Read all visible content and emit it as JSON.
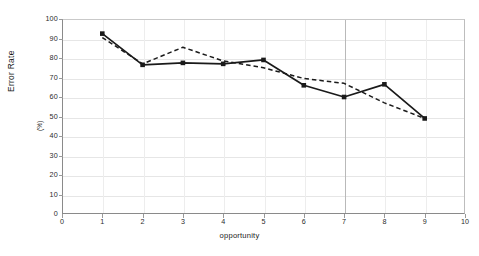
{
  "chart_data": {
    "type": "line",
    "title": "",
    "xlabel": "opportunity",
    "ylabel": "Error Rate",
    "ylabel_unit": "(%)",
    "xlim": [
      0,
      10
    ],
    "ylim": [
      0,
      100
    ],
    "xticks": [
      0,
      1,
      2,
      3,
      4,
      5,
      6,
      7,
      8,
      9,
      10
    ],
    "yticks": [
      0,
      10,
      20,
      30,
      40,
      50,
      60,
      70,
      80,
      90,
      100
    ],
    "grid": true,
    "legend": "none",
    "x": [
      1,
      2,
      3,
      4,
      5,
      6,
      7,
      8,
      9
    ],
    "series": [
      {
        "name": "solid",
        "style": "solid",
        "marker": "square",
        "color": "#1a1a1a",
        "values": [
          92.5,
          76.5,
          77.5,
          77.0,
          79.0,
          66.0,
          60.0,
          66.5,
          49.0
        ]
      },
      {
        "name": "dashed",
        "style": "dashed",
        "marker": "none",
        "color": "#1a1a1a",
        "values": [
          90.5,
          77.0,
          85.5,
          78.5,
          75.0,
          69.5,
          67.0,
          57.0,
          49.0
        ]
      }
    ],
    "annotations": [
      {
        "type": "vertical-line",
        "x": 7,
        "color": "#b9b9b9"
      }
    ]
  },
  "axis": {
    "y_labels": [
      "100",
      "90",
      "80",
      "70",
      "60",
      "50",
      "40",
      "30",
      "20",
      "10",
      "0"
    ],
    "x_labels": [
      "0",
      "1",
      "2",
      "3",
      "4",
      "5",
      "6",
      "7",
      "8",
      "9",
      "10"
    ]
  }
}
